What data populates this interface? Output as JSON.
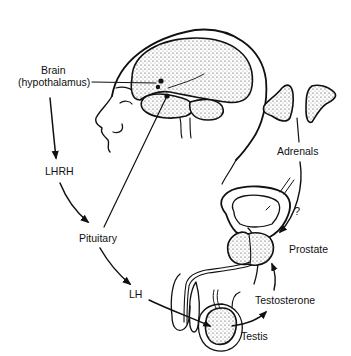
{
  "labels": {
    "brain": "Brain",
    "hypothalamus": "(hypothalamus)",
    "lhrh": "LHRH",
    "pituitary": "Pituitary",
    "lh": "LH",
    "adrenals": "Adrenals",
    "question": "?",
    "prostate": "Prostate",
    "testosterone": "Testosterone",
    "testis": "Testis"
  },
  "colors": {
    "ink": "#111111",
    "background": "#ffffff"
  }
}
